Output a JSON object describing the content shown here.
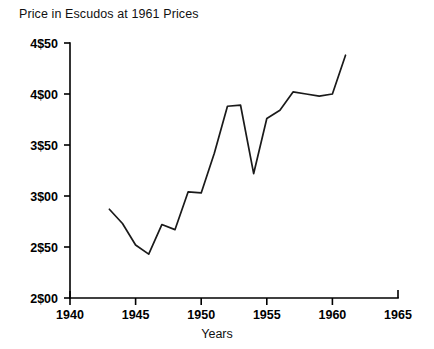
{
  "chart_data": {
    "type": "line",
    "title": "Price in Escudos at 1961 Prices",
    "xlabel": "Years",
    "ylabel": "",
    "xlim": [
      1940,
      1965
    ],
    "ylim": [
      2.0,
      4.5
    ],
    "xticks": [
      1940,
      1945,
      1950,
      1955,
      1960,
      1965
    ],
    "xticklabels": [
      "1940",
      "1945",
      "1950",
      "1955",
      "1960",
      "1965"
    ],
    "yticks": [
      2.0,
      2.5,
      3.0,
      3.5,
      4.0,
      4.5
    ],
    "yticklabels": [
      "2$00",
      "2$50",
      "3$00",
      "3$50",
      "4$00",
      "4$50"
    ],
    "grid": false,
    "legend": false,
    "line_color": "#1a1a1a",
    "x": [
      1943,
      1944,
      1945,
      1946,
      1947,
      1948,
      1949,
      1950,
      1951,
      1952,
      1953,
      1954,
      1955,
      1956,
      1957,
      1958,
      1959,
      1960,
      1961
    ],
    "values": [
      2.87,
      2.73,
      2.52,
      2.43,
      2.72,
      2.67,
      3.04,
      3.03,
      3.42,
      3.88,
      3.89,
      3.22,
      3.76,
      3.84,
      4.02,
      4.0,
      3.98,
      4.0,
      4.38
    ],
    "series": [
      {
        "name": "Price in Escudos at 1961 Prices",
        "values": [
          2.87,
          2.73,
          2.52,
          2.43,
          2.72,
          2.67,
          3.04,
          3.03,
          3.42,
          3.88,
          3.89,
          3.22,
          3.76,
          3.84,
          4.02,
          4.0,
          3.98,
          4.0,
          4.38
        ]
      }
    ]
  }
}
